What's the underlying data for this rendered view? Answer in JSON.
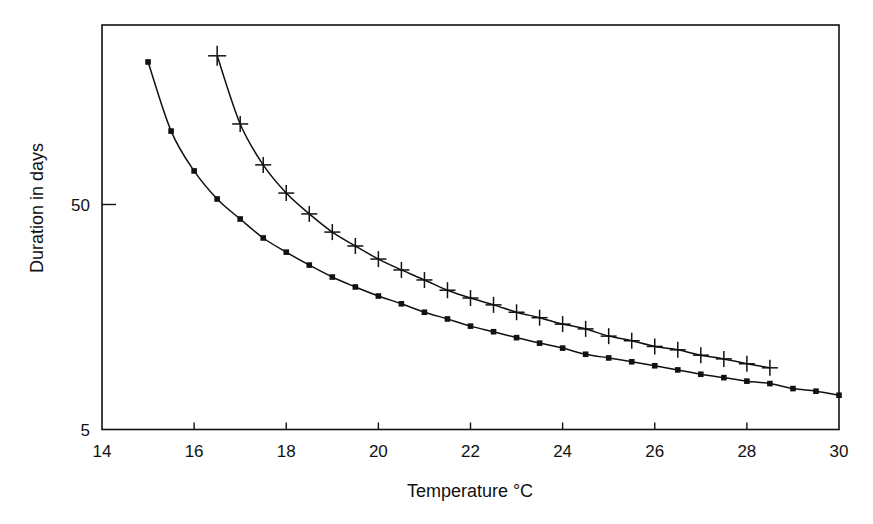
{
  "chart_data": {
    "type": "line",
    "title": "",
    "xlabel": "Temperature °C",
    "ylabel": "Duration in days",
    "xlim": [
      14,
      30
    ],
    "ylim": [
      5,
      320
    ],
    "yscale": "log",
    "grid": false,
    "legend": null,
    "x_ticks": [
      14,
      16,
      18,
      20,
      22,
      24,
      26,
      28,
      30
    ],
    "x_tick_labels": [
      "14",
      "16",
      "18",
      "20",
      "22",
      "24",
      "26",
      "28",
      "30"
    ],
    "y_ticks": [
      5,
      50
    ],
    "y_tick_labels": [
      "5",
      "50"
    ],
    "series": [
      {
        "name": "square-marker series",
        "marker": "square",
        "x": [
          15,
          15.5,
          16,
          16.5,
          17,
          17.5,
          18,
          18.5,
          19,
          19.5,
          20,
          20.5,
          21,
          21.5,
          22,
          22.5,
          23,
          23.5,
          24,
          24.5,
          25,
          25.5,
          26,
          26.5,
          27,
          27.5,
          28,
          28.5,
          29,
          29.5,
          30
        ],
        "values": [
          215,
          106,
          70.5,
          52.9,
          43.1,
          35.5,
          30.7,
          26.9,
          23.8,
          21.5,
          19.6,
          18.1,
          16.6,
          15.5,
          14.4,
          13.6,
          12.8,
          12.1,
          11.5,
          10.8,
          10.4,
          10.0,
          9.6,
          9.2,
          8.8,
          8.5,
          8.2,
          8.0,
          7.6,
          7.4,
          7.1
        ]
      },
      {
        "name": "cross-marker series",
        "marker": "cross",
        "x": [
          16.5,
          17,
          17.5,
          18,
          18.5,
          19,
          19.5,
          20,
          20.5,
          21,
          21.5,
          22,
          22.5,
          23,
          23.5,
          24,
          24.5,
          25,
          25.5,
          26,
          26.5,
          27,
          27.5,
          28,
          28.5
        ],
        "values": [
          229,
          114,
          75,
          56.2,
          45.4,
          37.7,
          32.7,
          28.6,
          25.6,
          23.1,
          20.8,
          19.2,
          17.9,
          16.6,
          15.7,
          14.7,
          14.0,
          13.0,
          12.4,
          11.7,
          11.3,
          10.7,
          10.3,
          9.8,
          9.4
        ]
      }
    ]
  },
  "colors": {
    "ink": "#111111",
    "background": "#ffffff"
  }
}
